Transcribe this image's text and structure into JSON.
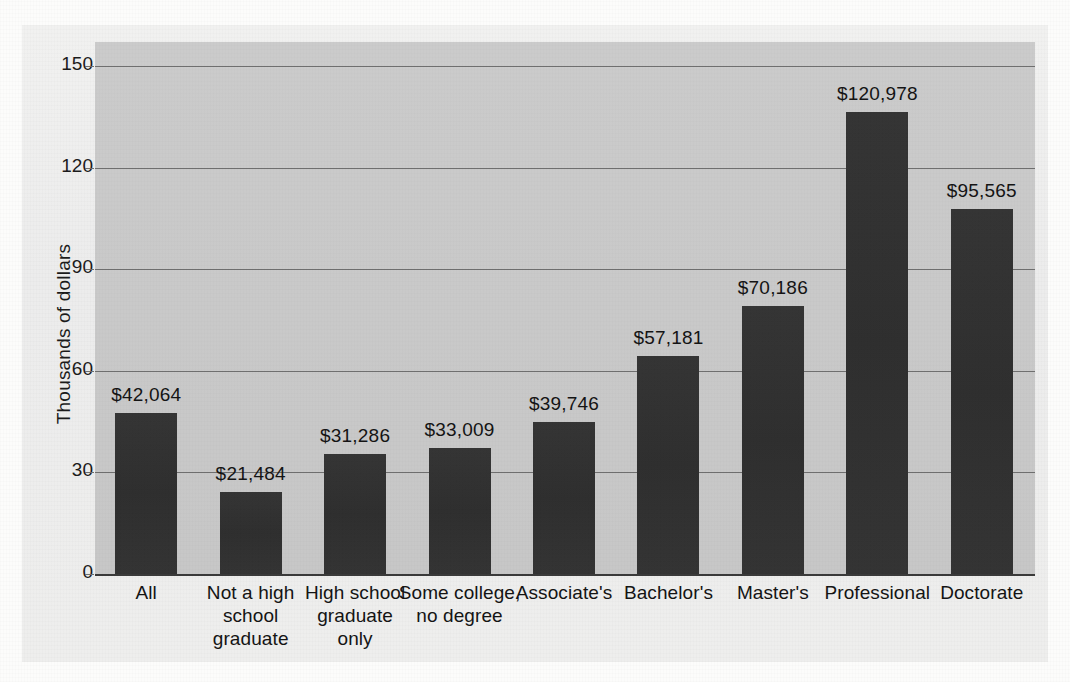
{
  "chart_data": {
    "type": "bar",
    "title": "",
    "xlabel": "",
    "ylabel": "Thousands of dollars",
    "ylim": [
      0,
      150
    ],
    "ytick_values": [
      0,
      30,
      60,
      90,
      120,
      150
    ],
    "ytick_labels": [
      "0",
      "30",
      "60",
      "90",
      "120",
      "150"
    ],
    "grid": true,
    "legend": "none",
    "units": "dollars",
    "categories": [
      "All",
      "Not a high school graduate",
      "High school graduate only",
      "Some college, no degree",
      "Associate's",
      "Bachelor's",
      "Master's",
      "Professional",
      "Doctorate"
    ],
    "category_lines": [
      [
        "All"
      ],
      [
        "Not a high",
        "school",
        "graduate"
      ],
      [
        "High school",
        "graduate",
        "only"
      ],
      [
        "Some college,",
        "no degree"
      ],
      [
        "Associate's"
      ],
      [
        "Bachelor's"
      ],
      [
        "Master's"
      ],
      [
        "Professional"
      ],
      [
        "Doctorate"
      ]
    ],
    "values": [
      42064,
      21484,
      31286,
      33009,
      39746,
      57181,
      70186,
      120978,
      95565
    ],
    "value_labels": [
      "$42,064",
      "$21,484",
      "$31,286",
      "$33,009",
      "$39,746",
      "$57,181",
      "$70,186",
      "$120,978",
      "$95,565"
    ],
    "colors": {
      "bar": "#333333",
      "plot_background": "#c9c9c9",
      "figure_background": "#efefef",
      "gridline": "#6f6f6f",
      "axis": "#3a3a3a",
      "text": "#141414"
    }
  }
}
